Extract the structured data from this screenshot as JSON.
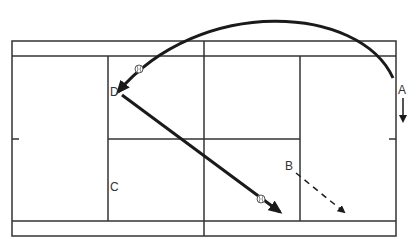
{
  "diagram": {
    "type": "tennis-court-drill",
    "colors": {
      "line": "#333333",
      "shot": "#1a1a1a",
      "background": "#ffffff"
    },
    "players": [
      {
        "id": "A",
        "label": "A",
        "x": 402,
        "y": 90
      },
      {
        "id": "B",
        "label": "B",
        "x": 291,
        "y": 166
      },
      {
        "id": "C",
        "label": "C",
        "x": 114,
        "y": 187
      },
      {
        "id": "D",
        "label": "D",
        "x": 113,
        "y": 95
      }
    ],
    "shots": [
      {
        "id": "lob",
        "from": "A",
        "to": "D",
        "style": "solid-curve",
        "ball_marker": true
      },
      {
        "id": "drive",
        "from": "D",
        "to": "deep-right",
        "style": "solid",
        "ball_marker": true
      },
      {
        "id": "movement-B",
        "from": "B",
        "to": "deep-right",
        "style": "dashed"
      },
      {
        "id": "movement-A",
        "from": "A",
        "to": "down",
        "style": "solid-short"
      }
    ],
    "icons": {
      "ball": "tennis-ball-icon",
      "arrow": "arrowhead-icon"
    }
  }
}
